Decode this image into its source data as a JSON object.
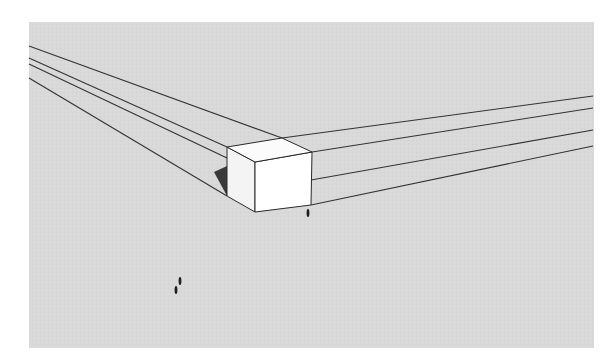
{
  "viewport": {
    "type": "3d-modeling-canvas",
    "background_color": "#ffffff",
    "ground_color": "#d9d9d9",
    "ground_rect": {
      "x": 29,
      "y": 22,
      "width": 565,
      "height": 326
    },
    "edge_color": "#333333",
    "face_color": "#ffffff",
    "shadow_color": "#3a3a3a"
  },
  "scene": {
    "box_object": {
      "name": "cube",
      "top_face": [
        [
          227,
          147
        ],
        [
          282,
          138
        ],
        [
          312,
          152
        ],
        [
          255,
          162
        ]
      ],
      "left_face": [
        [
          227,
          147
        ],
        [
          255,
          162
        ],
        [
          255,
          212
        ],
        [
          227,
          196
        ]
      ],
      "right_face": [
        [
          255,
          162
        ],
        [
          312,
          152
        ],
        [
          311,
          205
        ],
        [
          255,
          212
        ]
      ]
    },
    "guide_lines_left": [
      {
        "from": [
          29,
          46
        ],
        "to": [
          282,
          138
        ]
      },
      {
        "from": [
          29,
          58
        ],
        "to": [
          227,
          147
        ]
      },
      {
        "from": [
          29,
          64
        ],
        "to": [
          227,
          158
        ]
      },
      {
        "from": [
          29,
          78
        ],
        "to": [
          227,
          196
        ]
      }
    ],
    "guide_lines_right": [
      {
        "from": [
          282,
          138
        ],
        "to": [
          593,
          96
        ]
      },
      {
        "from": [
          312,
          152
        ],
        "to": [
          593,
          108
        ]
      },
      {
        "from": [
          311,
          180
        ],
        "to": [
          593,
          130
        ]
      },
      {
        "from": [
          311,
          205
        ],
        "to": [
          593,
          146
        ]
      }
    ],
    "shadow": [
      [
        214,
        172
      ],
      [
        227,
        166
      ],
      [
        227,
        196
      ]
    ],
    "human_figures": [
      {
        "x": 308,
        "y": 213
      },
      {
        "x": 176,
        "y": 290
      },
      {
        "x": 180,
        "y": 281
      }
    ]
  }
}
